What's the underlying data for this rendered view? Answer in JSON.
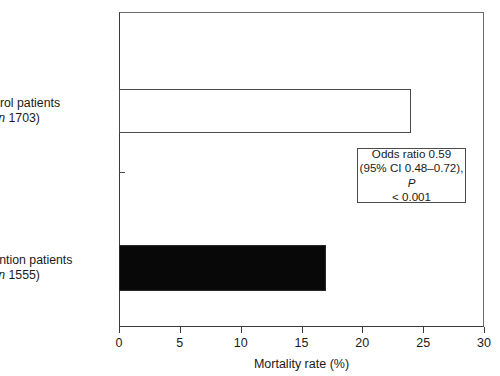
{
  "chart_data": {
    "type": "bar",
    "orientation": "horizontal",
    "title": "",
    "xlabel": "Mortality rate (%)",
    "ylabel": "",
    "xlim": [
      0,
      30
    ],
    "xticks": [
      0,
      5,
      10,
      15,
      20,
      25,
      30
    ],
    "xtick_labels": [
      "0",
      "5",
      "10",
      "15",
      "20",
      "25",
      "30"
    ],
    "grid": false,
    "legend": null,
    "categories": [
      "Control patients (n 1703)",
      "Intervention patients (n 1555)"
    ],
    "values": [
      24,
      17
    ],
    "series": [
      {
        "name": "Mortality rate",
        "values": [
          24,
          17
        ]
      }
    ],
    "bars": [
      {
        "category_line1": "Control patients",
        "category_line2_prefix": "(",
        "category_line2_italic": "n",
        "category_line2_suffix": " 1703)",
        "n": 1703,
        "value": 24,
        "style": "open",
        "fill": "#ffffff",
        "stroke": "#4a4a4a"
      },
      {
        "category_line1": "Intervention patients",
        "category_line2_prefix": "(",
        "category_line2_italic": "n",
        "category_line2_suffix": " 1555)",
        "n": 1555,
        "value": 17,
        "style": "filled",
        "fill": "#080808",
        "stroke": "#2a2a2a"
      }
    ],
    "annotations": [
      {
        "line1": "Odds ratio 0.59",
        "line2": "(95% CI 0.48–0.72),",
        "line3_italic": "P",
        "line3_rest": " < 0.001",
        "odds_ratio": 0.59,
        "ci_low": 0.48,
        "ci_high": 0.72,
        "p_value": "< 0.001"
      }
    ]
  },
  "axis": {
    "x_title": "Mortality rate (%)",
    "tick_0": "0",
    "tick_1": "5",
    "tick_2": "10",
    "tick_3": "15",
    "tick_4": "20",
    "tick_5": "25",
    "tick_6": "30"
  },
  "labels": {
    "control_line1": "Control patients",
    "control_n_open": "(",
    "control_n_italic": "n",
    "control_n_rest": " 1703)",
    "intervention_line1": "Intervention patients",
    "intervention_n_open": "(",
    "intervention_n_italic": "n",
    "intervention_n_rest": " 1555)"
  },
  "annotation_box": {
    "line1": "Odds ratio 0.59",
    "line2": "(95% CI 0.48–0.72),",
    "line3_italic": "P",
    "line3_rest": " < 0.001"
  },
  "colors": {
    "bar_open_fill": "#ffffff",
    "bar_open_stroke": "#4a4a4a",
    "bar_filled_fill": "#080808",
    "axis": "#3a3a3a",
    "text": "#1a1a1a",
    "background": "#ffffff"
  }
}
